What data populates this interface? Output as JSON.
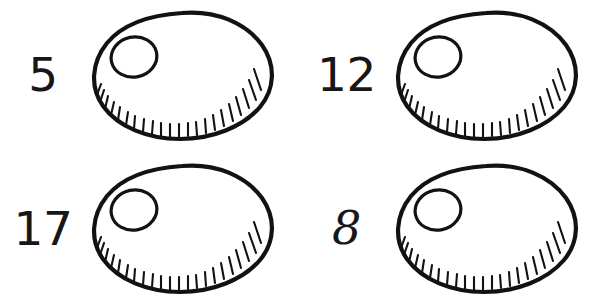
{
  "page": {
    "background_color": "#ffffff",
    "ink_color": "#121214",
    "width": 607,
    "height": 307
  },
  "items": [
    {
      "id": "item-1",
      "label": "5",
      "value": 5,
      "numeral_style": "plain",
      "figure": "shell-with-hole-and-fringe",
      "position": "top-left"
    },
    {
      "id": "item-2",
      "label": "12",
      "value": 12,
      "numeral_style": "plain",
      "figure": "shell-with-hole-and-fringe",
      "position": "top-right"
    },
    {
      "id": "item-3",
      "label": "17",
      "value": 17,
      "numeral_style": "plain",
      "figure": "shell-with-hole-and-fringe",
      "position": "bottom-left"
    },
    {
      "id": "item-4",
      "label": "8",
      "value": 8,
      "numeral_style": "script",
      "figure": "shell-with-hole-and-fringe",
      "position": "bottom-right"
    }
  ],
  "figure_spec": {
    "name": "shell-with-hole-and-fringe",
    "description": "Hand-drawn oval shell outline with a small circular hole near the upper-left and short radiating fringe strokes along the lower-right inner edge",
    "fringe_tick_count": 22,
    "outline_stroke_width": 4.2,
    "hole_stroke_width": 3.2,
    "fringe_stroke_width": 2.1
  }
}
